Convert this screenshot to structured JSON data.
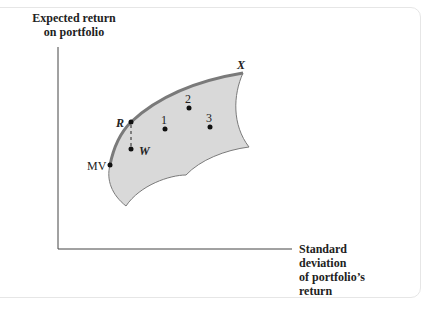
{
  "diagram": {
    "y_axis_label": [
      "Expected return",
      "on portfolio"
    ],
    "x_axis_label": [
      "Standard",
      "deviation",
      "of portfolio’s",
      "return"
    ],
    "region_fill": "#d9d9d9",
    "frontier_color": "#7a7a7a",
    "points": [
      {
        "id": "MV",
        "label": "MV",
        "x": 110,
        "y": 165
      },
      {
        "id": "R",
        "label": "R",
        "x": 131,
        "y": 122
      },
      {
        "id": "W",
        "label": "W",
        "x": 131,
        "y": 149
      },
      {
        "id": "1",
        "label": "1",
        "x": 165,
        "y": 129
      },
      {
        "id": "2",
        "label": "2",
        "x": 189,
        "y": 108
      },
      {
        "id": "3",
        "label": "3",
        "x": 210,
        "y": 127
      },
      {
        "id": "X",
        "label": "X",
        "x": 243,
        "y": 73
      }
    ]
  }
}
